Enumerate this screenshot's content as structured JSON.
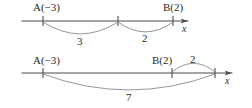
{
  "figure": {
    "title": "",
    "background_color": "#ffffff",
    "ink_color": "#4a4a4a",
    "text_color": "#2b2b2b"
  },
  "diagrams": [
    {
      "id": "top",
      "axis_label": "x",
      "points": [
        {
          "label": "A(−3)",
          "value": -3
        },
        {
          "label": "B(2)",
          "value": 2
        }
      ],
      "arcs": [
        {
          "label": "3",
          "from": -3,
          "to": 0,
          "direction": "below"
        },
        {
          "label": "2",
          "from": 0,
          "to": 2,
          "direction": "below"
        }
      ]
    },
    {
      "id": "bottom",
      "axis_label": "x",
      "points": [
        {
          "label": "A(−3)",
          "value": -3
        },
        {
          "label": "B(2)",
          "value": 2
        }
      ],
      "arcs": [
        {
          "label": "2",
          "from": 2,
          "to": 4,
          "direction": "above"
        },
        {
          "label": "7",
          "from": -3,
          "to": 4,
          "direction": "below"
        }
      ]
    }
  ]
}
